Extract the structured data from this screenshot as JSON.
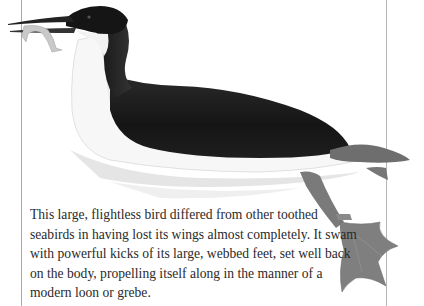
{
  "page": {
    "type": "illustrated book page",
    "illustration": {
      "subject": "flightless toothed seabird swimming, holding a fish in its beak",
      "colors": {
        "plumage_dark": "#1c1c1c",
        "belly": "#f6f6f6",
        "legs_feet": "#7d7d7d",
        "water_shadow": "#dcdcdc",
        "fish": "#bfbfbf"
      }
    },
    "caption": {
      "lines": [
        "This large, flightless bird differed from other toothed",
        "seabirds in having lost its wings almost completely. It swam",
        "with powerful kicks of its large, webbed feet, set well back",
        "on the body, propelling itself along in the manner of a",
        "modern loon or grebe."
      ]
    }
  }
}
